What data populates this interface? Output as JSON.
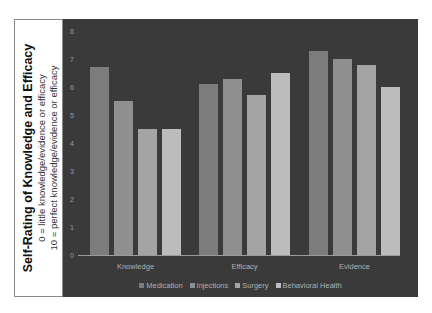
{
  "title_box": {
    "title": "Self-Rating of Knowledge and Efficacy",
    "line1": "0 = little knowledge/evidence or efficacy",
    "line2": "10 = perfect knowledge/evidence or efficacy"
  },
  "colors": {
    "background": "#3a3a3a",
    "Medication": "#7c7c7c",
    "Injections": "#8f8f8f",
    "Surgery": "#a4a4a4",
    "Behavioral Health": "#bcbcbc"
  },
  "chart_data": {
    "type": "bar",
    "title": "Self-Rating of Knowledge and Efficacy",
    "subtitle": "0 = little knowledge/evidence or efficacy; 10 = perfect knowledge/evidence or efficacy",
    "xlabel": "",
    "ylabel": "",
    "categories": [
      "Knowledge",
      "Efficacy",
      "Evidence"
    ],
    "series": [
      {
        "name": "Medication",
        "values": [
          6.7,
          6.1,
          7.3
        ]
      },
      {
        "name": "Injections",
        "values": [
          5.5,
          6.3,
          7.0
        ]
      },
      {
        "name": "Surgery",
        "values": [
          4.5,
          5.7,
          6.8
        ]
      },
      {
        "name": "Behavioral Health",
        "values": [
          4.5,
          6.5,
          6.0
        ]
      }
    ],
    "ylim": [
      0,
      8
    ],
    "yticks": [
      "0",
      "1",
      "2",
      "3",
      "4",
      "5",
      "6",
      "7",
      "8"
    ],
    "grid": false,
    "legend_position": "bottom"
  }
}
